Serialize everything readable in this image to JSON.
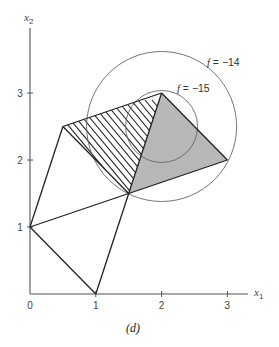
{
  "figure": {
    "caption": "(d)",
    "axes": {
      "x_label_main": "x",
      "x_label_sub": "1",
      "y_label_main": "x",
      "y_label_sub": "2",
      "x_ticks": [
        "0",
        "1",
        "2",
        "3"
      ],
      "y_ticks": [
        "1",
        "2",
        "3"
      ]
    },
    "level_curves": [
      {
        "f_symbol": "f",
        "eq": " = −14",
        "value": -14,
        "center": [
          2,
          2.5
        ],
        "radius": 1.13
      },
      {
        "f_symbol": "f",
        "eq": " = −15",
        "value": -15,
        "center": [
          2,
          2.5
        ],
        "radius": 0.55
      }
    ],
    "vertices": {
      "A": [
        0,
        1
      ],
      "B": [
        1,
        0
      ],
      "C": [
        1.5,
        1.5
      ],
      "D": [
        0.5,
        2.5
      ],
      "E": [
        2,
        3
      ],
      "F": [
        3,
        2
      ]
    },
    "regions": {
      "hatched": "quadrilateral C–D–E (region bounded by (1.5,1.5), (0.5,2.5), (2,3))",
      "shaded": "triangle C–E–F ((1.5,1.5), (2,3), (3,2))"
    },
    "colors": {
      "shaded_fill": "#b8b8b8",
      "edge": "#222222",
      "circle": "#666666",
      "axis": "#555555"
    }
  }
}
